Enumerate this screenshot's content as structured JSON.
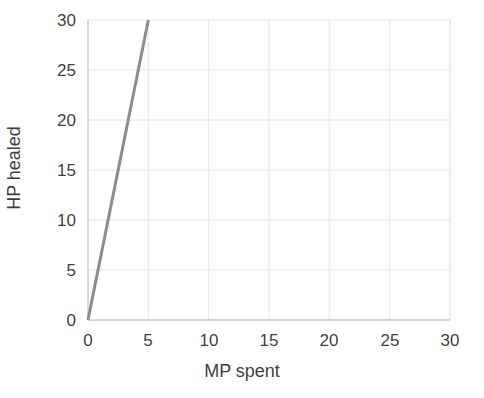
{
  "chart_data": {
    "type": "line",
    "title": "",
    "subtitle": "",
    "xlabel": "MP spent",
    "ylabel": "HP healed",
    "xlim": [
      0,
      30
    ],
    "ylim": [
      0,
      30
    ],
    "xticks": [
      0,
      5,
      10,
      15,
      20,
      25,
      30
    ],
    "yticks": [
      0,
      5,
      10,
      15,
      20,
      25,
      30
    ],
    "xtick_labels": [
      "0",
      "5",
      "10",
      "15",
      "20",
      "25",
      "30"
    ],
    "ytick_labels": [
      "0",
      "5",
      "10",
      "15",
      "20",
      "25",
      "30"
    ],
    "grid": true,
    "legend": false,
    "legend_position": "none",
    "annotations": [],
    "series": [
      {
        "name": "HP healed",
        "color": "#8c8c8c",
        "line_width": 3,
        "slope": 6,
        "intercept": 0,
        "x": [
          0,
          1,
          2,
          3,
          4,
          5
        ],
        "values": [
          0,
          6,
          12,
          18,
          24,
          30
        ]
      }
    ]
  },
  "colors": {
    "background": "#ffffff",
    "plot_background": "#ffffff",
    "grid": "#e6e6e6",
    "axis": "#d4d4d4",
    "text": "#3f3f3f",
    "series_line": "#8c8c8c"
  },
  "axes": {
    "x_title": "MP spent",
    "y_title": "HP healed"
  }
}
